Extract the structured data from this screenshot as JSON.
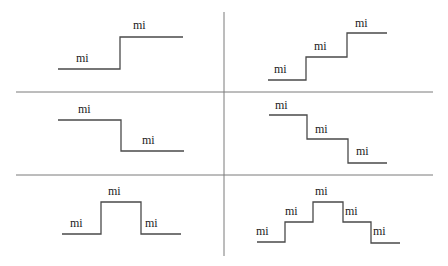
{
  "diagram": {
    "title": "",
    "grid": {
      "rows": 3,
      "cols": 2
    },
    "line_color": "#4a4a4a",
    "divider_color": "#7a7a7a",
    "panels": [
      {
        "id": "step-up-one",
        "position": "row-1-left",
        "description": "single step up",
        "labels": [
          "mi",
          "mi"
        ]
      },
      {
        "id": "step-up-two",
        "position": "row-1-right",
        "description": "two steps up (staircase ascending)",
        "labels": [
          "mi",
          "mi",
          "mi"
        ]
      },
      {
        "id": "step-down-one",
        "position": "row-2-left",
        "description": "single step down",
        "labels": [
          "mi",
          "mi"
        ]
      },
      {
        "id": "step-down-two",
        "position": "row-2-right",
        "description": "two steps down (staircase descending)",
        "labels": [
          "mi",
          "mi",
          "mi"
        ]
      },
      {
        "id": "pulse-one",
        "position": "row-3-left",
        "description": "single-level pulse (up then down)",
        "labels": [
          "mi",
          "mi",
          "mi"
        ]
      },
      {
        "id": "pulse-two",
        "position": "row-3-right",
        "description": "two-level pyramid (up, up, down, down)",
        "labels": [
          "mi",
          "mi",
          "mi",
          "mi",
          "mi"
        ]
      }
    ]
  }
}
